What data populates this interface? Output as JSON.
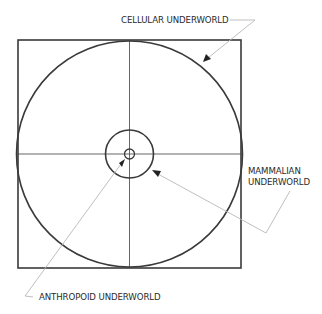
{
  "diagram": {
    "type": "concentric-circles-in-square",
    "labels": {
      "cellular": "CELLULAR UNDERWORLD",
      "mammalian_line1": "MAMMALIAN",
      "mammalian_line2": "UNDERWORLD",
      "anthropoid": "ANTHROPOID UNDERWORLD"
    },
    "colors": {
      "stroke": "#3a3a3a",
      "leader": "#b8b8b8",
      "text": "#2a2a2a",
      "background": "#ffffff"
    },
    "shapes": {
      "square": {
        "x": 18,
        "y": 40,
        "width": 223,
        "height": 228
      },
      "center": {
        "x": 129.5,
        "y": 154
      },
      "large_circle_radius": 113,
      "medium_circle_radius": 24,
      "small_circle_radius": 5
    }
  }
}
